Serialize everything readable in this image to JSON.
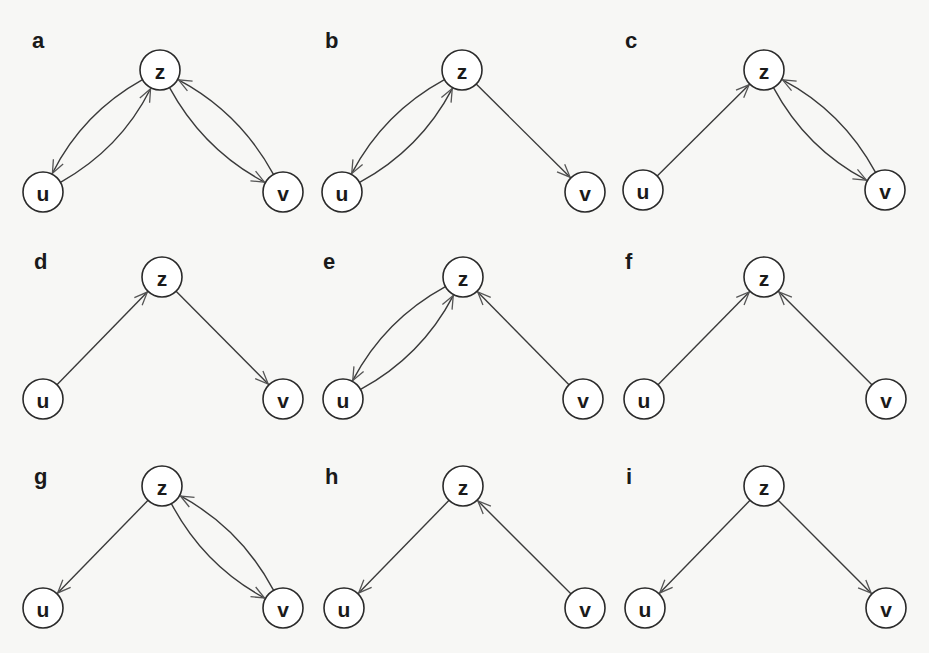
{
  "figure": {
    "node_radius": 20,
    "colors": {
      "stroke": "#2a2a2a",
      "node_fill": "#ffffff",
      "background": "#f7f7f5"
    },
    "panels": [
      {
        "label": "a",
        "ox": 0,
        "oy": 0,
        "label_pos": [
          32,
          48
        ],
        "nodes": {
          "z": [
            160,
            70
          ],
          "u": [
            43,
            192
          ],
          "v": [
            283,
            192
          ]
        },
        "edges": [
          {
            "from": "z",
            "to": "u",
            "curve": "outer"
          },
          {
            "from": "u",
            "to": "z",
            "curve": "inner"
          },
          {
            "from": "z",
            "to": "v",
            "curve": "inner"
          },
          {
            "from": "v",
            "to": "z",
            "curve": "outer"
          }
        ]
      },
      {
        "label": "b",
        "ox": 299,
        "oy": 0,
        "label_pos": [
          26,
          48
        ],
        "nodes": {
          "z": [
            163,
            70
          ],
          "u": [
            43,
            192
          ],
          "v": [
            286,
            192
          ]
        },
        "edges": [
          {
            "from": "z",
            "to": "u",
            "curve": "outer"
          },
          {
            "from": "u",
            "to": "z",
            "curve": "inner"
          },
          {
            "from": "z",
            "to": "v",
            "curve": "none"
          }
        ]
      },
      {
        "label": "c",
        "ox": 600,
        "oy": 0,
        "label_pos": [
          25,
          48
        ],
        "nodes": {
          "z": [
            164,
            70
          ],
          "u": [
            43,
            190
          ],
          "v": [
            285,
            190
          ]
        },
        "edges": [
          {
            "from": "u",
            "to": "z",
            "curve": "none"
          },
          {
            "from": "z",
            "to": "v",
            "curve": "inner"
          },
          {
            "from": "v",
            "to": "z",
            "curve": "outer"
          }
        ]
      },
      {
        "label": "d",
        "ox": 0,
        "oy": 207,
        "label_pos": [
          34,
          62
        ],
        "nodes": {
          "z": [
            162,
            70
          ],
          "u": [
            43,
            192
          ],
          "v": [
            283,
            192
          ]
        },
        "edges": [
          {
            "from": "u",
            "to": "z",
            "curve": "none"
          },
          {
            "from": "z",
            "to": "v",
            "curve": "none"
          }
        ]
      },
      {
        "label": "e",
        "ox": 299,
        "oy": 207,
        "label_pos": [
          24,
          62
        ],
        "nodes": {
          "z": [
            164,
            70
          ],
          "u": [
            44,
            192
          ],
          "v": [
            284,
            192
          ]
        },
        "edges": [
          {
            "from": "z",
            "to": "u",
            "curve": "outer"
          },
          {
            "from": "u",
            "to": "z",
            "curve": "inner"
          },
          {
            "from": "v",
            "to": "z",
            "curve": "none"
          }
        ]
      },
      {
        "label": "f",
        "ox": 600,
        "oy": 207,
        "label_pos": [
          25,
          62
        ],
        "nodes": {
          "z": [
            164,
            70
          ],
          "u": [
            44,
            192
          ],
          "v": [
            286,
            192
          ]
        },
        "edges": [
          {
            "from": "u",
            "to": "z",
            "curve": "none"
          },
          {
            "from": "v",
            "to": "z",
            "curve": "none"
          }
        ]
      },
      {
        "label": "g",
        "ox": 0,
        "oy": 416,
        "label_pos": [
          34,
          68
        ],
        "nodes": {
          "z": [
            162,
            70
          ],
          "u": [
            43,
            192
          ],
          "v": [
            283,
            192
          ]
        },
        "edges": [
          {
            "from": "z",
            "to": "u",
            "curve": "none"
          },
          {
            "from": "z",
            "to": "v",
            "curve": "inner"
          },
          {
            "from": "v",
            "to": "z",
            "curve": "outer"
          }
        ]
      },
      {
        "label": "h",
        "ox": 299,
        "oy": 416,
        "label_pos": [
          26,
          68
        ],
        "nodes": {
          "z": [
            164,
            70
          ],
          "u": [
            45,
            192
          ],
          "v": [
            286,
            192
          ]
        },
        "edges": [
          {
            "from": "z",
            "to": "u",
            "curve": "none"
          },
          {
            "from": "v",
            "to": "z",
            "curve": "none"
          }
        ]
      },
      {
        "label": "i",
        "ox": 600,
        "oy": 416,
        "label_pos": [
          26,
          68
        ],
        "nodes": {
          "z": [
            164,
            70
          ],
          "u": [
            45,
            192
          ],
          "v": [
            286,
            192
          ]
        },
        "edges": [
          {
            "from": "z",
            "to": "u",
            "curve": "none"
          },
          {
            "from": "z",
            "to": "v",
            "curve": "none"
          }
        ]
      }
    ]
  }
}
